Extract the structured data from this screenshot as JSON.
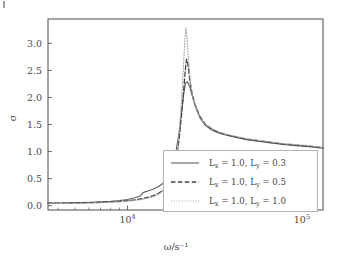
{
  "figure": {
    "background_color": "#ffffff",
    "frame_color": "#4d4d4d",
    "tick_color": "#6e6e6e",
    "text_color": "#3f3f3f"
  },
  "chart_data": {
    "type": "line",
    "title": "",
    "subtitle": "",
    "xlabel": "ω/s⁻¹",
    "ylabel": "σ",
    "xscale": "log",
    "yscale": "linear",
    "xlim": [
      3500,
      132000
    ],
    "ylim": [
      -0.08,
      3.45
    ],
    "grid": false,
    "legend_position": "center-right",
    "x_major_ticks": [
      {
        "value": 10000,
        "label": "10",
        "exponent": "4"
      },
      {
        "value": 100000,
        "label": "10",
        "exponent": "5"
      }
    ],
    "y_ticks": [
      0.0,
      0.5,
      1.0,
      1.5,
      2.0,
      2.5,
      3.0
    ],
    "y_tick_labels": [
      "0.0",
      "0.5",
      "1.0",
      "1.5",
      "2.0",
      "2.5",
      "3.0"
    ],
    "series": [
      {
        "name": "Lx=1.0, Ly=0.3",
        "legend_label_parts": {
          "lx_symbol": "L",
          "lx_sub": "x",
          "lx_value": "1.0",
          "ly_symbol": "L",
          "ly_sub": "y",
          "ly_value": "0.3"
        },
        "linestyle": "solid",
        "color": "#5f5f5f",
        "linewidth": 1.1,
        "peak_x": 21500,
        "peak_y": 2.29,
        "x": [
          3500,
          4000,
          4600,
          5300,
          6100,
          7000,
          8000,
          9000,
          10000,
          11000,
          11600,
          11900,
          12200,
          12600,
          13200,
          14000,
          15000,
          16000,
          17000,
          18000,
          19000,
          19800,
          20500,
          21000,
          21500,
          22000,
          22700,
          23500,
          24500,
          26000,
          28000,
          30000,
          33000,
          37000,
          42000,
          48000,
          56000,
          66000,
          78000,
          92000,
          110000,
          132000
        ],
        "y": [
          0.048,
          0.05,
          0.053,
          0.057,
          0.062,
          0.07,
          0.081,
          0.095,
          0.115,
          0.145,
          0.168,
          0.185,
          0.24,
          0.255,
          0.275,
          0.305,
          0.35,
          0.415,
          0.52,
          0.7,
          1.02,
          1.38,
          1.78,
          2.07,
          2.26,
          2.29,
          2.2,
          2.03,
          1.83,
          1.62,
          1.48,
          1.41,
          1.35,
          1.3,
          1.26,
          1.22,
          1.19,
          1.16,
          1.13,
          1.11,
          1.09,
          1.06
        ]
      },
      {
        "name": "Lx=1.0, Ly=0.5",
        "legend_label_parts": {
          "lx_symbol": "L",
          "lx_sub": "x",
          "lx_value": "1.0",
          "ly_symbol": "L",
          "ly_sub": "y",
          "ly_value": "0.5"
        },
        "linestyle": "dashed",
        "color": "#454545",
        "linewidth": 1.3,
        "peak_x": 21800,
        "peak_y": 2.71,
        "x": [
          3500,
          4000,
          4600,
          5300,
          6100,
          7000,
          8000,
          9000,
          10000,
          11000,
          12000,
          13000,
          14000,
          15000,
          16000,
          17000,
          18000,
          19000,
          19800,
          20500,
          21000,
          21500,
          21800,
          22200,
          22800,
          23500,
          24500,
          26000,
          28000,
          30000,
          33000,
          37000,
          42000,
          48000,
          56000,
          66000,
          78000,
          92000,
          110000,
          132000
        ],
        "y": [
          0.044,
          0.046,
          0.048,
          0.051,
          0.055,
          0.061,
          0.069,
          0.079,
          0.092,
          0.108,
          0.128,
          0.152,
          0.183,
          0.225,
          0.29,
          0.385,
          0.55,
          0.84,
          1.25,
          1.75,
          2.15,
          2.55,
          2.71,
          2.6,
          2.3,
          2.05,
          1.85,
          1.65,
          1.5,
          1.43,
          1.36,
          1.31,
          1.27,
          1.23,
          1.2,
          1.17,
          1.14,
          1.12,
          1.1,
          1.07
        ]
      },
      {
        "name": "Lx=1.0, Ly=1.0",
        "legend_label_parts": {
          "lx_symbol": "L",
          "lx_sub": "x",
          "lx_value": "1.0",
          "ly_symbol": "L",
          "ly_sub": "y",
          "ly_value": "1.0"
        },
        "linestyle": "dotted",
        "color": "#a8a8a8",
        "linewidth": 1.1,
        "peak_x": 21600,
        "peak_y": 3.29,
        "x": [
          3500,
          4000,
          4600,
          5300,
          6100,
          7000,
          8000,
          9000,
          10000,
          11000,
          12000,
          13000,
          14000,
          15000,
          16000,
          17000,
          18000,
          19000,
          19800,
          20400,
          20900,
          21300,
          21600,
          21900,
          22300,
          22900,
          23600,
          24600,
          26000,
          28000,
          30000,
          33000,
          37000,
          42000,
          48000,
          56000,
          66000,
          78000,
          92000,
          110000,
          132000
        ],
        "y": [
          0.04,
          0.042,
          0.044,
          0.046,
          0.05,
          0.055,
          0.062,
          0.071,
          0.082,
          0.096,
          0.114,
          0.136,
          0.165,
          0.205,
          0.265,
          0.36,
          0.53,
          0.86,
          1.38,
          1.95,
          2.55,
          3.05,
          3.29,
          3.15,
          2.75,
          2.3,
          2.0,
          1.82,
          1.63,
          1.5,
          1.44,
          1.37,
          1.32,
          1.28,
          1.24,
          1.21,
          1.18,
          1.15,
          1.13,
          1.11,
          1.08
        ]
      }
    ]
  },
  "legend": {
    "border_color": "#b4b4b4",
    "background": "#ffffff",
    "entries": [
      {
        "label": "L_x = 1.0, L_y = 0.3",
        "linestyle": "solid"
      },
      {
        "label": "L_x = 1.0, L_y = 0.5",
        "linestyle": "dashed"
      },
      {
        "label": "L_x = 1.0, L_y = 1.0",
        "linestyle": "dotted"
      }
    ]
  }
}
